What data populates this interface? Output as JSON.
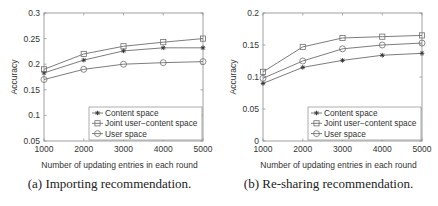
{
  "chart_data": [
    {
      "type": "line",
      "title": "",
      "caption": "(a) Importing recommendation.",
      "xlabel": "Number of updating entries in each round",
      "ylabel": "Accuracy",
      "x": [
        1000,
        2000,
        3000,
        4000,
        5000
      ],
      "xticks": [
        "1000",
        "2000",
        "3000",
        "4000",
        "5000"
      ],
      "ylim": [
        0.05,
        0.3
      ],
      "yticks": [
        "0.05",
        "0.1",
        "0.15",
        "0.2",
        "0.25",
        "0.3"
      ],
      "yticks_values": [
        0.05,
        0.1,
        0.15,
        0.2,
        0.25,
        0.3
      ],
      "grid": false,
      "legend_position": "lower right",
      "series": [
        {
          "name": "Content space",
          "marker": "asterisk",
          "values": [
            0.183,
            0.208,
            0.226,
            0.232,
            0.232
          ]
        },
        {
          "name": "Joint user−content space",
          "marker": "square",
          "values": [
            0.19,
            0.22,
            0.235,
            0.243,
            0.25
          ]
        },
        {
          "name": "User space",
          "marker": "circle",
          "values": [
            0.17,
            0.19,
            0.2,
            0.203,
            0.205
          ]
        }
      ]
    },
    {
      "type": "line",
      "title": "",
      "caption": "(b) Re-sharing recommendation.",
      "xlabel": "Number of updating entries in each round",
      "ylabel": "Accuracy",
      "x": [
        1000,
        2000,
        3000,
        4000,
        5000
      ],
      "xticks": [
        "1000",
        "2000",
        "3000",
        "4000",
        "5000"
      ],
      "ylim": [
        0,
        0.2
      ],
      "yticks": [
        "0",
        "0.05",
        "0.1",
        "0.15",
        "0.2"
      ],
      "yticks_values": [
        0,
        0.05,
        0.1,
        0.15,
        0.2
      ],
      "grid": false,
      "legend_position": "lower right",
      "series": [
        {
          "name": "Content space",
          "marker": "asterisk",
          "values": [
            0.09,
            0.115,
            0.126,
            0.134,
            0.137
          ]
        },
        {
          "name": "Joint user−content space",
          "marker": "square",
          "values": [
            0.108,
            0.147,
            0.161,
            0.163,
            0.165
          ]
        },
        {
          "name": "User space",
          "marker": "circle",
          "values": [
            0.098,
            0.125,
            0.144,
            0.15,
            0.153
          ]
        }
      ]
    }
  ],
  "colors": {
    "axis": "#8a8a8a",
    "line": "#6e6e6e",
    "text": "#333333"
  }
}
